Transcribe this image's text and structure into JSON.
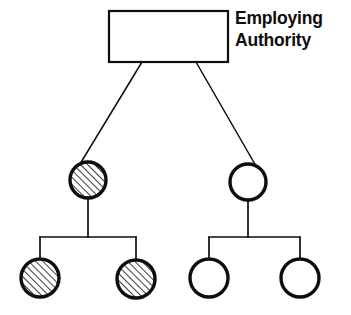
{
  "diagram": {
    "title_label": {
      "line1": "Employing",
      "line2": "Authority"
    },
    "colors": {
      "stroke": "#0d0d0d",
      "fill_empty": "#ffffff",
      "hatch_line": "#1a1a1a",
      "background": "#ffffff"
    },
    "root_box": {
      "name": "employing-authority-box",
      "x": 109,
      "y": 11,
      "width": 119,
      "height": 51,
      "stroke_width": 2.2,
      "fill": "#ffffff"
    },
    "nodes": [
      {
        "id": "node-l2-left",
        "name": "hatched-circle-level2-left",
        "level": 2,
        "cx": 88,
        "cy": 180,
        "r": 18,
        "fill_style": "hatched",
        "stroke_width": 3.4
      },
      {
        "id": "node-l2-right",
        "name": "empty-circle-level2-right",
        "level": 2,
        "cx": 248,
        "cy": 182,
        "r": 18,
        "fill_style": "empty",
        "stroke_width": 3.4
      },
      {
        "id": "node-l3-1",
        "name": "hatched-circle-level3-first",
        "level": 3,
        "cx": 40,
        "cy": 278,
        "r": 19,
        "fill_style": "hatched",
        "stroke_width": 3.4
      },
      {
        "id": "node-l3-2",
        "name": "hatched-circle-level3-second",
        "level": 3,
        "cx": 136,
        "cy": 279,
        "r": 19,
        "fill_style": "hatched",
        "stroke_width": 3.4
      },
      {
        "id": "node-l3-3",
        "name": "empty-circle-level3-third",
        "level": 3,
        "cx": 209,
        "cy": 278,
        "r": 19,
        "fill_style": "empty",
        "stroke_width": 3.4
      },
      {
        "id": "node-l3-4",
        "name": "empty-circle-level3-fourth",
        "level": 3,
        "cx": 300,
        "cy": 278,
        "r": 19,
        "fill_style": "empty",
        "stroke_width": 3.4
      }
    ],
    "connectors": [
      {
        "name": "connector-root-to-left",
        "type": "diagonal",
        "x1": 142,
        "y1": 62,
        "x2": 80,
        "y2": 164,
        "stroke_width": 1.5
      },
      {
        "name": "connector-root-to-right",
        "type": "diagonal",
        "x1": 196,
        "y1": 62,
        "x2": 256,
        "y2": 166,
        "stroke_width": 1.5
      },
      {
        "name": "connector-left-stem",
        "type": "vertical",
        "x1": 88,
        "y1": 198,
        "x2": 88,
        "y2": 237,
        "stroke_width": 1.6
      },
      {
        "name": "connector-left-bar",
        "type": "horizontal",
        "x1": 40,
        "y1": 237,
        "x2": 136,
        "y2": 237,
        "stroke_width": 1.6
      },
      {
        "name": "connector-left-drop-1",
        "type": "vertical",
        "x1": 40,
        "y1": 237,
        "x2": 40,
        "y2": 259,
        "stroke_width": 1.6
      },
      {
        "name": "connector-left-drop-2",
        "type": "vertical",
        "x1": 136,
        "y1": 237,
        "x2": 136,
        "y2": 260,
        "stroke_width": 1.6
      },
      {
        "name": "connector-right-stem",
        "type": "vertical",
        "x1": 248,
        "y1": 200,
        "x2": 248,
        "y2": 237,
        "stroke_width": 1.6
      },
      {
        "name": "connector-right-bar",
        "type": "horizontal",
        "x1": 209,
        "y1": 237,
        "x2": 300,
        "y2": 237,
        "stroke_width": 1.6
      },
      {
        "name": "connector-right-drop-1",
        "type": "vertical",
        "x1": 209,
        "y1": 237,
        "x2": 209,
        "y2": 259,
        "stroke_width": 1.6
      },
      {
        "name": "connector-right-drop-2",
        "type": "vertical",
        "x1": 300,
        "y1": 237,
        "x2": 300,
        "y2": 259,
        "stroke_width": 1.6
      }
    ],
    "label_position": {
      "x": 235,
      "line1_y": 23,
      "line2_y": 45
    },
    "hatch": {
      "angle_deg": 45,
      "spacing": 5,
      "line_width": 1.6
    }
  }
}
